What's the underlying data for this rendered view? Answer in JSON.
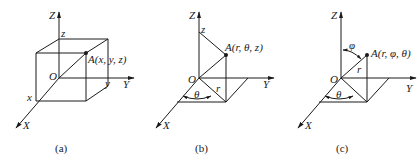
{
  "panels": [
    {
      "caption": "(a)",
      "system": "cartesian",
      "labels": {
        "z_axis": "Z",
        "y_axis": "Y",
        "x_axis": "X",
        "origin": "O",
        "z_tick": "z",
        "y_tick": "y",
        "x_tick": "x",
        "point": "A(x, y, z)"
      }
    },
    {
      "caption": "(b)",
      "system": "cylindrical",
      "labels": {
        "z_axis": "Z",
        "y_axis": "Y",
        "x_axis": "X",
        "origin": "O",
        "z_tick": "z",
        "radius": "r",
        "angle": "θ",
        "point": "A(r, θ, z)"
      }
    },
    {
      "caption": "(c)",
      "system": "spherical",
      "labels": {
        "z_axis": "Z",
        "y_axis": "Y",
        "x_axis": "X",
        "origin": "O",
        "radius": "r",
        "polar_angle": "φ",
        "azimuth": "θ",
        "point": "A(r, φ, θ)"
      }
    }
  ]
}
